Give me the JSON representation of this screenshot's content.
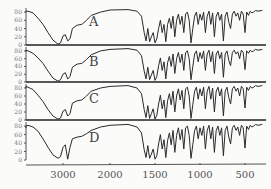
{
  "chart_data": {
    "type": "line",
    "title": "",
    "xlabel": "",
    "ylabel": "",
    "x_reversed": true,
    "xlim": [
      4200,
      200
    ],
    "ylim": [
      0,
      90
    ],
    "x_ticks": [
      3000,
      2000,
      1500,
      1000,
      500
    ],
    "x_tick_labels": [
      "3000",
      "2000",
      "1500",
      "1000",
      "500"
    ],
    "y_ticks": [
      0,
      20,
      40,
      60,
      80
    ],
    "y_tick_labels": [
      "0",
      "20",
      "40",
      "60",
      "80"
    ],
    "grid": false,
    "legend": "none",
    "panels": [
      {
        "name": "A",
        "x": [
          4100,
          3900,
          3700,
          3600,
          3500,
          3400,
          3300,
          3200,
          3100,
          3050,
          3000,
          2950,
          2900,
          2850,
          2800,
          2700,
          2600,
          2500,
          2400,
          2200,
          2000,
          1800,
          1700,
          1650,
          1620,
          1600,
          1580,
          1560,
          1540,
          1520,
          1500,
          1480,
          1460,
          1440,
          1420,
          1400,
          1380,
          1360,
          1340,
          1320,
          1300,
          1280,
          1260,
          1240,
          1220,
          1200,
          1180,
          1160,
          1140,
          1120,
          1100,
          1080,
          1060,
          1040,
          1020,
          1000,
          980,
          960,
          940,
          920,
          900,
          880,
          860,
          840,
          820,
          800,
          780,
          760,
          740,
          720,
          700,
          680,
          660,
          640,
          620,
          600,
          580,
          560,
          540,
          520,
          500,
          480,
          460,
          440,
          420,
          400,
          380,
          350,
          300
        ],
        "y": [
          80,
          82,
          82,
          78,
          65,
          50,
          30,
          12,
          2,
          5,
          22,
          25,
          10,
          15,
          40,
          48,
          50,
          60,
          72,
          80,
          85,
          86,
          82,
          70,
          30,
          10,
          40,
          8,
          20,
          30,
          5,
          15,
          40,
          60,
          30,
          50,
          8,
          50,
          65,
          40,
          70,
          20,
          60,
          75,
          50,
          70,
          30,
          75,
          80,
          60,
          5,
          40,
          70,
          80,
          50,
          75,
          60,
          80,
          30,
          70,
          82,
          50,
          78,
          20,
          70,
          80,
          60,
          75,
          10,
          70,
          80,
          55,
          40,
          75,
          82,
          70,
          78,
          60,
          82,
          75,
          30,
          80,
          72,
          82,
          78,
          80,
          84,
          82,
          84
        ]
      },
      {
        "name": "B",
        "x": [
          4100,
          3900,
          3700,
          3600,
          3500,
          3400,
          3300,
          3200,
          3100,
          3050,
          3000,
          2950,
          2900,
          2850,
          2800,
          2700,
          2600,
          2500,
          2400,
          2200,
          2000,
          1800,
          1700,
          1650,
          1620,
          1600,
          1580,
          1560,
          1540,
          1520,
          1500,
          1480,
          1460,
          1440,
          1420,
          1400,
          1380,
          1360,
          1340,
          1320,
          1300,
          1280,
          1260,
          1240,
          1220,
          1200,
          1180,
          1160,
          1140,
          1120,
          1100,
          1080,
          1060,
          1040,
          1020,
          1000,
          980,
          960,
          940,
          920,
          900,
          880,
          860,
          840,
          820,
          800,
          780,
          760,
          740,
          720,
          700,
          680,
          660,
          640,
          620,
          600,
          580,
          560,
          540,
          520,
          500,
          480,
          460,
          440,
          420,
          400,
          380,
          350,
          300
        ],
        "y": [
          78,
          82,
          80,
          74,
          62,
          48,
          28,
          10,
          2,
          6,
          20,
          24,
          8,
          14,
          38,
          46,
          48,
          58,
          70,
          80,
          84,
          86,
          82,
          68,
          28,
          8,
          38,
          6,
          18,
          30,
          4,
          14,
          42,
          62,
          30,
          52,
          8,
          50,
          66,
          40,
          72,
          22,
          60,
          76,
          50,
          72,
          30,
          76,
          80,
          60,
          6,
          40,
          72,
          80,
          52,
          76,
          60,
          80,
          30,
          72,
          82,
          52,
          78,
          22,
          72,
          80,
          60,
          76,
          12,
          72,
          80,
          56,
          42,
          76,
          82,
          72,
          78,
          60,
          82,
          76,
          32,
          80,
          74,
          82,
          78,
          80,
          84,
          82,
          84
        ]
      },
      {
        "name": "C",
        "x": [
          4100,
          3900,
          3700,
          3600,
          3500,
          3400,
          3300,
          3200,
          3100,
          3050,
          3000,
          2950,
          2900,
          2850,
          2800,
          2700,
          2600,
          2500,
          2400,
          2200,
          2000,
          1800,
          1700,
          1650,
          1620,
          1600,
          1580,
          1560,
          1540,
          1520,
          1500,
          1480,
          1460,
          1440,
          1420,
          1400,
          1380,
          1360,
          1340,
          1320,
          1300,
          1280,
          1260,
          1240,
          1220,
          1200,
          1180,
          1160,
          1140,
          1120,
          1100,
          1080,
          1060,
          1040,
          1020,
          1000,
          980,
          960,
          940,
          920,
          900,
          880,
          860,
          840,
          820,
          800,
          780,
          760,
          740,
          720,
          700,
          680,
          660,
          640,
          620,
          600,
          580,
          560,
          540,
          520,
          500,
          480,
          460,
          440,
          420,
          400,
          380,
          350,
          300
        ],
        "y": [
          80,
          84,
          82,
          76,
          62,
          46,
          26,
          10,
          2,
          5,
          22,
          26,
          10,
          16,
          42,
          48,
          50,
          60,
          72,
          80,
          84,
          86,
          80,
          66,
          26,
          6,
          36,
          4,
          16,
          28,
          2,
          12,
          40,
          62,
          28,
          50,
          6,
          48,
          66,
          38,
          72,
          20,
          60,
          78,
          50,
          74,
          28,
          78,
          82,
          60,
          4,
          38,
          72,
          82,
          52,
          78,
          60,
          82,
          28,
          72,
          84,
          52,
          80,
          20,
          72,
          82,
          60,
          78,
          10,
          72,
          82,
          56,
          40,
          78,
          84,
          72,
          80,
          60,
          84,
          78,
          30,
          82,
          74,
          84,
          80,
          82,
          86,
          84,
          86
        ]
      },
      {
        "name": "D",
        "x": [
          4100,
          3900,
          3700,
          3600,
          3500,
          3400,
          3300,
          3200,
          3100,
          3050,
          3000,
          2950,
          2900,
          2850,
          2800,
          2700,
          2600,
          2500,
          2400,
          2200,
          2000,
          1800,
          1700,
          1650,
          1620,
          1600,
          1580,
          1560,
          1540,
          1520,
          1500,
          1480,
          1460,
          1440,
          1420,
          1400,
          1380,
          1360,
          1340,
          1320,
          1300,
          1280,
          1260,
          1240,
          1220,
          1200,
          1180,
          1160,
          1140,
          1120,
          1100,
          1080,
          1060,
          1040,
          1020,
          1000,
          980,
          960,
          940,
          920,
          900,
          880,
          860,
          840,
          820,
          800,
          780,
          760,
          740,
          720,
          700,
          680,
          660,
          640,
          620,
          600,
          580,
          560,
          540,
          520,
          500,
          480,
          460,
          440,
          420,
          400,
          380,
          350,
          300
        ],
        "y": [
          75,
          80,
          82,
          78,
          68,
          50,
          30,
          12,
          4,
          8,
          30,
          36,
          2,
          30,
          50,
          54,
          56,
          62,
          70,
          78,
          82,
          84,
          78,
          64,
          24,
          6,
          34,
          4,
          14,
          26,
          2,
          10,
          38,
          60,
          26,
          48,
          6,
          46,
          64,
          36,
          70,
          18,
          58,
          76,
          48,
          72,
          26,
          76,
          80,
          58,
          4,
          36,
          70,
          80,
          50,
          76,
          58,
          80,
          26,
          70,
          82,
          50,
          78,
          18,
          70,
          80,
          58,
          76,
          10,
          70,
          80,
          54,
          38,
          76,
          82,
          70,
          78,
          58,
          82,
          76,
          28,
          80,
          72,
          82,
          78,
          80,
          84,
          82,
          84
        ]
      }
    ]
  }
}
